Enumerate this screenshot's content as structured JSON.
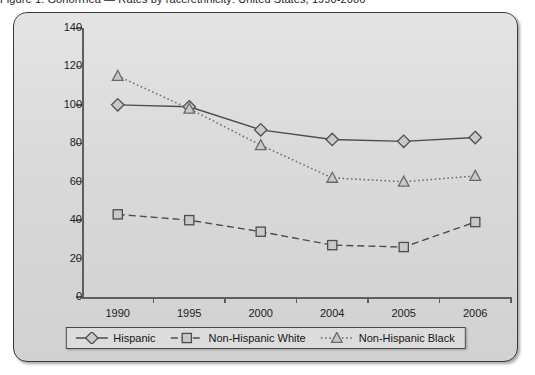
{
  "cut_caption": "Figure 1. Gonorrhea — Rates by race/ethnicity: United States, 1990-2006",
  "chart_data": {
    "type": "line",
    "title": "",
    "subtitle": "",
    "xlabel": "",
    "ylabel": "",
    "categories": [
      "1990",
      "1995",
      "2000",
      "2004",
      "2005",
      "2006"
    ],
    "ylim": [
      0,
      140
    ],
    "yticks": [
      0,
      20,
      40,
      60,
      80,
      100,
      120,
      140
    ],
    "ytick_labels": [
      "0",
      "20",
      "40",
      "60",
      "80",
      "100",
      "120",
      "140"
    ],
    "grid": false,
    "legend_position": "bottom-center",
    "series": [
      {
        "name": "Hispanic",
        "marker": "diamond",
        "line_style": "solid",
        "color": "#4d4d4d",
        "values": [
          100,
          99,
          87,
          82,
          81,
          83
        ]
      },
      {
        "name": "Non-Hispanic White",
        "marker": "square",
        "line_style": "dashed",
        "color": "#4d4d4d",
        "values": [
          43,
          40,
          34,
          27,
          26,
          39
        ]
      },
      {
        "name": "Non-Hispanic Black",
        "marker": "triangle",
        "line_style": "dotted",
        "color": "#6a6a6a",
        "values": [
          115,
          98,
          79,
          62,
          60,
          63
        ]
      }
    ]
  },
  "legend": {
    "items": [
      {
        "label": "Hispanic",
        "marker": "diamond-marker",
        "line_style": "solid"
      },
      {
        "label": "Non-Hispanic White",
        "marker": "square-marker",
        "line_style": "dashed"
      },
      {
        "label": "Non-Hispanic Black",
        "marker": "triangle-marker",
        "line_style": "dotted"
      }
    ]
  },
  "colors": {
    "panel_background": "#d9d9d9",
    "panel_border": "#3a3a3a",
    "axis": "#5e5e5e",
    "text": "#1c1c1c",
    "series_dark": "#4d4d4d",
    "marker_fill": "#c9c9c9"
  }
}
